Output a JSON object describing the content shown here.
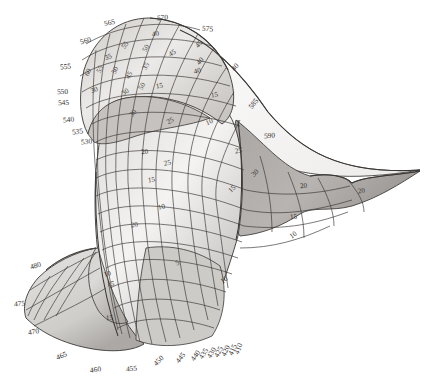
{
  "chart_data": {
    "type": "surface-3d",
    "title": "",
    "subtitle": "",
    "xlabel": "",
    "ylabel": "",
    "zlabel": "",
    "grid": true,
    "legend": "none",
    "palette": {
      "background": "#ffffff",
      "line": "#3a3735",
      "fill_light": "#f2f1f0",
      "fill_mid": "#d8d6d4",
      "fill_dark": "#b4b1ae",
      "fill_darker": "#9c9996",
      "label": "#33302f"
    },
    "axis_ticks": {
      "values": [
        450,
        455,
        460,
        465,
        470,
        475,
        480,
        530,
        535,
        540,
        545,
        550,
        555,
        560,
        565,
        570,
        575,
        580,
        585,
        590
      ],
      "min": 450,
      "max": 590,
      "step": 5
    },
    "contour_levels": {
      "values": [
        5,
        10,
        15,
        20,
        25,
        30,
        35,
        40,
        45,
        50,
        55
      ],
      "min": 5,
      "max": 55,
      "step": 5
    },
    "axis_tick_labels": [
      {
        "text": "565",
        "x": 104,
        "y": 19,
        "rot": -12
      },
      {
        "text": "570",
        "x": 157,
        "y": 14,
        "rot": -4
      },
      {
        "text": "575",
        "x": 202,
        "y": 25,
        "rot": 6
      },
      {
        "text": "560",
        "x": 80,
        "y": 37,
        "rot": -16
      },
      {
        "text": "555",
        "x": 60,
        "y": 63,
        "rot": -6
      },
      {
        "text": "550",
        "x": 57,
        "y": 88,
        "rot": -3
      },
      {
        "text": "545",
        "x": 58,
        "y": 99,
        "rot": -3
      },
      {
        "text": "540",
        "x": 63,
        "y": 116,
        "rot": -7
      },
      {
        "text": "535",
        "x": 72,
        "y": 128,
        "rot": -9
      },
      {
        "text": "530",
        "x": 81,
        "y": 138,
        "rot": -7
      },
      {
        "text": "585",
        "x": 248,
        "y": 100,
        "rot": -52
      },
      {
        "text": "590",
        "x": 264,
        "y": 132,
        "rot": -4
      },
      {
        "text": "480",
        "x": 30,
        "y": 262,
        "rot": -18
      },
      {
        "text": "475",
        "x": 14,
        "y": 300,
        "rot": -4
      },
      {
        "text": "470",
        "x": 28,
        "y": 328,
        "rot": -10
      },
      {
        "text": "465",
        "x": 56,
        "y": 352,
        "rot": -22
      },
      {
        "text": "460",
        "x": 90,
        "y": 366,
        "rot": -8
      },
      {
        "text": "455",
        "x": 126,
        "y": 365,
        "rot": -4
      },
      {
        "text": "450",
        "x": 153,
        "y": 357,
        "rot": -44
      },
      {
        "text": "445",
        "x": 175,
        "y": 354,
        "rot": -52
      },
      {
        "text": "440",
        "x": 190,
        "y": 352,
        "rot": -56
      },
      {
        "text": "435",
        "x": 198,
        "y": 350,
        "rot": -58
      },
      {
        "text": "430",
        "x": 206,
        "y": 349,
        "rot": -60
      },
      {
        "text": "425",
        "x": 213,
        "y": 348,
        "rot": -62
      },
      {
        "text": "420",
        "x": 220,
        "y": 347,
        "rot": -64
      },
      {
        "text": "415",
        "x": 227,
        "y": 346,
        "rot": -66
      },
      {
        "text": "410",
        "x": 233,
        "y": 345,
        "rot": -68
      }
    ],
    "contour_labels": [
      {
        "text": "40",
        "x": 152,
        "y": 31,
        "rot": -8
      },
      {
        "text": "55",
        "x": 122,
        "y": 42,
        "rot": -55
      },
      {
        "text": "50",
        "x": 143,
        "y": 45,
        "rot": -60
      },
      {
        "text": "45",
        "x": 169,
        "y": 50,
        "rot": -34
      },
      {
        "text": "45",
        "x": 196,
        "y": 41,
        "rot": -50
      },
      {
        "text": "40",
        "x": 197,
        "y": 58,
        "rot": -48
      },
      {
        "text": "35",
        "x": 105,
        "y": 54,
        "rot": -22
      },
      {
        "text": "35",
        "x": 143,
        "y": 63,
        "rot": -60
      },
      {
        "text": "60",
        "x": 85,
        "y": 69,
        "rot": -62
      },
      {
        "text": "55",
        "x": 97,
        "y": 66,
        "rot": -62
      },
      {
        "text": "50",
        "x": 112,
        "y": 67,
        "rot": -62
      },
      {
        "text": "45",
        "x": 126,
        "y": 72,
        "rot": -58
      },
      {
        "text": "40",
        "x": 194,
        "y": 68,
        "rot": -16
      },
      {
        "text": "40",
        "x": 232,
        "y": 64,
        "rot": -48
      },
      {
        "text": "30",
        "x": 91,
        "y": 87,
        "rot": -22
      },
      {
        "text": "30",
        "x": 122,
        "y": 89,
        "rot": -34
      },
      {
        "text": "50",
        "x": 139,
        "y": 83,
        "rot": -60
      },
      {
        "text": "15",
        "x": 156,
        "y": 83,
        "rot": -10
      },
      {
        "text": "15",
        "x": 211,
        "y": 92,
        "rot": -8
      },
      {
        "text": "30",
        "x": 130,
        "y": 110,
        "rot": -52
      },
      {
        "text": "10",
        "x": 206,
        "y": 119,
        "rot": -26
      },
      {
        "text": "25",
        "x": 167,
        "y": 118,
        "rot": -30
      },
      {
        "text": "25",
        "x": 235,
        "y": 148,
        "rot": -8
      },
      {
        "text": "20",
        "x": 141,
        "y": 149,
        "rot": -6
      },
      {
        "text": "25",
        "x": 164,
        "y": 160,
        "rot": -12
      },
      {
        "text": "30",
        "x": 252,
        "y": 170,
        "rot": -44
      },
      {
        "text": "15",
        "x": 148,
        "y": 177,
        "rot": -8
      },
      {
        "text": "15",
        "x": 229,
        "y": 186,
        "rot": -44
      },
      {
        "text": "20",
        "x": 300,
        "y": 183,
        "rot": -6
      },
      {
        "text": "20",
        "x": 358,
        "y": 188,
        "rot": -10
      },
      {
        "text": "10",
        "x": 158,
        "y": 204,
        "rot": -14
      },
      {
        "text": "15",
        "x": 290,
        "y": 214,
        "rot": -6
      },
      {
        "text": "20",
        "x": 131,
        "y": 222,
        "rot": -10
      },
      {
        "text": "10",
        "x": 290,
        "y": 232,
        "rot": -36
      },
      {
        "text": "5",
        "x": 176,
        "y": 260,
        "rot": -26
      },
      {
        "text": "10",
        "x": 221,
        "y": 277,
        "rot": -36
      },
      {
        "text": "10",
        "x": 104,
        "y": 271,
        "rot": -18
      },
      {
        "text": "15",
        "x": 107,
        "y": 281,
        "rot": -4
      },
      {
        "text": "15",
        "x": 106,
        "y": 315,
        "rot": -4
      }
    ]
  }
}
